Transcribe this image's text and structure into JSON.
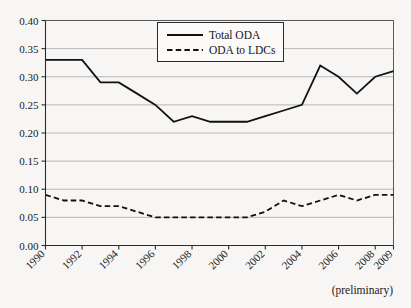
{
  "chart_data": {
    "type": "line",
    "title": "",
    "subtitle": "",
    "xlabel": "",
    "ylabel": "",
    "grid": true,
    "legend_position": "top-center",
    "xlim": [
      1990,
      2009
    ],
    "ylim": [
      0.0,
      0.4
    ],
    "yticks": [
      "0.00",
      "0.05",
      "0.10",
      "0.15",
      "0.20",
      "0.25",
      "0.30",
      "0.35",
      "0.40"
    ],
    "ytick_values": [
      0.0,
      0.05,
      0.1,
      0.15,
      0.2,
      0.25,
      0.3,
      0.35,
      0.4
    ],
    "xticks": [
      "1990",
      "1992",
      "1994",
      "1996",
      "1998",
      "2000",
      "2002",
      "2004",
      "2006",
      "2008",
      "2009"
    ],
    "xtick_values": [
      1990,
      1992,
      1994,
      1996,
      1998,
      2000,
      2002,
      2004,
      2006,
      2008,
      2009
    ],
    "x": [
      1990,
      1991,
      1992,
      1993,
      1994,
      1995,
      1996,
      1997,
      1998,
      1999,
      2000,
      2001,
      2002,
      2003,
      2004,
      2005,
      2006,
      2007,
      2008,
      2009
    ],
    "series": [
      {
        "name": "Total ODA",
        "style": "solid",
        "color": "#111111",
        "values": [
          0.33,
          0.33,
          0.33,
          0.29,
          0.29,
          0.27,
          0.25,
          0.22,
          0.23,
          0.22,
          0.22,
          0.22,
          0.23,
          0.24,
          0.25,
          0.32,
          0.3,
          0.27,
          0.3,
          0.31
        ]
      },
      {
        "name": "ODA to LDCs",
        "style": "dashed",
        "color": "#111111",
        "values": [
          0.09,
          0.08,
          0.08,
          0.07,
          0.07,
          0.06,
          0.05,
          0.05,
          0.05,
          0.05,
          0.05,
          0.05,
          0.06,
          0.08,
          0.07,
          0.08,
          0.09,
          0.08,
          0.09,
          0.09
        ]
      }
    ],
    "annotations": [
      {
        "name": "preliminary-note",
        "text": "(preliminary)"
      }
    ]
  },
  "legend": {
    "entries": [
      {
        "label": "Total ODA",
        "style": "solid"
      },
      {
        "label": "ODA to LDCs",
        "style": "dashed"
      }
    ]
  },
  "colors": {
    "background": "#f7f6f4",
    "gridline": "#a8a8a8",
    "axis": "#2b2b2b",
    "series": "#111111"
  }
}
